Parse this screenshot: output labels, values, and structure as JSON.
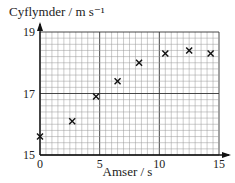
{
  "chart_data": {
    "type": "scatter",
    "title": "",
    "xlabel": "Amser / s",
    "ylabel": "Cyflymder / m s⁻¹",
    "xlim": [
      0,
      15
    ],
    "ylim": [
      15,
      19
    ],
    "x_ticks": [
      "0",
      "5",
      "10",
      "15"
    ],
    "y_ticks": [
      "15",
      "17",
      "19"
    ],
    "grid": true,
    "marker": "x",
    "series": [
      {
        "name": "data",
        "points": [
          {
            "x": 0,
            "y": 15.6
          },
          {
            "x": 2.7,
            "y": 16.1
          },
          {
            "x": 4.7,
            "y": 16.9
          },
          {
            "x": 6.5,
            "y": 17.4
          },
          {
            "x": 8.3,
            "y": 18.0
          },
          {
            "x": 10.5,
            "y": 18.3
          },
          {
            "x": 12.5,
            "y": 18.4
          },
          {
            "x": 14.3,
            "y": 18.3
          }
        ]
      }
    ]
  }
}
